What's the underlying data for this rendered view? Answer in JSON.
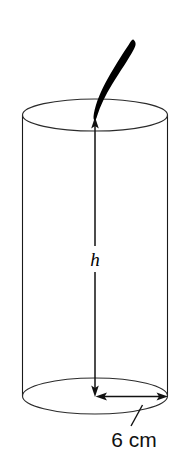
{
  "figure": {
    "kind": "geometry-diagram",
    "background_color": "#ffffff",
    "line_color": "#1a1a1a",
    "straw_color": "#000000",
    "labels": {
      "height_label": "h",
      "diameter_label": "6 cm"
    },
    "parts": {
      "cylinder_name": "cylinder-body",
      "top_ellipse_name": "cylinder-top-ellipse",
      "bottom_ellipse_name": "cylinder-bottom-ellipse",
      "left_wall_name": "cylinder-left-wall",
      "right_wall_name": "cylinder-right-wall",
      "height_arrow_name": "height-dimension-arrow",
      "radius_arrow_name": "radius-dimension-arrow",
      "leader_name": "dimension-leader-line",
      "straw_name": "curved-straw"
    },
    "geometry": {
      "canvas_width": 176,
      "canvas_height": 454,
      "cylinder_left_x": 22,
      "cylinder_right_x": 168,
      "top_center_y": 115,
      "bottom_center_y": 396,
      "top_ry": 16,
      "bottom_ry": 18,
      "axis_x": 95,
      "height_top_y": 118,
      "height_bottom_y": 396
    }
  }
}
